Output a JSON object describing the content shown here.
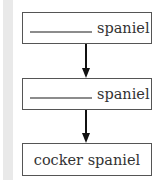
{
  "diagram": {
    "type": "flow-chain",
    "boxes": [
      {
        "blank": true,
        "text": "spaniel"
      },
      {
        "blank": true,
        "text": "spaniel"
      },
      {
        "blank": false,
        "text": "cocker spaniel"
      }
    ],
    "arrows": [
      {
        "from": 0,
        "to": 1,
        "direction": "down"
      },
      {
        "from": 1,
        "to": 2,
        "direction": "down"
      }
    ]
  },
  "colors": {
    "sidebar": "#e9e9e9",
    "box_border": "#555555",
    "blank_line": "#8c8c8c",
    "arrow": "#111111"
  }
}
